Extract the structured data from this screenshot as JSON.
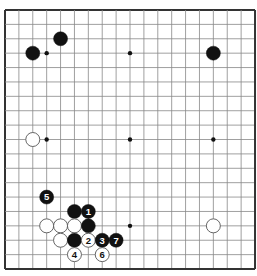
{
  "board": {
    "size": 19,
    "origin": {
      "x": 5,
      "y": 10
    },
    "step": {
      "x": 13.89,
      "y": 14.39
    },
    "line_color": "#888888",
    "border_color": "#333333",
    "background": "#ffffff",
    "hoshi": [
      [
        3,
        3
      ],
      [
        9,
        3
      ],
      [
        15,
        3
      ],
      [
        3,
        9
      ],
      [
        9,
        9
      ],
      [
        15,
        9
      ],
      [
        3,
        15
      ],
      [
        9,
        15
      ],
      [
        15,
        15
      ]
    ]
  },
  "stones": [
    {
      "color": "black",
      "col": 4,
      "row": 2,
      "label": ""
    },
    {
      "color": "black",
      "col": 2,
      "row": 3,
      "label": ""
    },
    {
      "color": "black",
      "col": 15,
      "row": 3,
      "label": ""
    },
    {
      "color": "white",
      "col": 2,
      "row": 9,
      "label": ""
    },
    {
      "color": "black",
      "col": 3,
      "row": 13,
      "label": "5"
    },
    {
      "color": "black",
      "col": 5,
      "row": 14,
      "label": ""
    },
    {
      "color": "black",
      "col": 6,
      "row": 14,
      "label": "1"
    },
    {
      "color": "white",
      "col": 3,
      "row": 15,
      "label": ""
    },
    {
      "color": "white",
      "col": 4,
      "row": 15,
      "label": ""
    },
    {
      "color": "white",
      "col": 5,
      "row": 15,
      "label": ""
    },
    {
      "color": "black",
      "col": 6,
      "row": 15,
      "label": ""
    },
    {
      "color": "white",
      "col": 15,
      "row": 15,
      "label": ""
    },
    {
      "color": "white",
      "col": 4,
      "row": 16,
      "label": ""
    },
    {
      "color": "black",
      "col": 5,
      "row": 16,
      "label": ""
    },
    {
      "color": "white",
      "col": 6,
      "row": 16,
      "label": "2"
    },
    {
      "color": "black",
      "col": 7,
      "row": 16,
      "label": "3"
    },
    {
      "color": "black",
      "col": 8,
      "row": 16,
      "label": "7"
    },
    {
      "color": "white",
      "col": 5,
      "row": 17,
      "label": "4"
    },
    {
      "color": "white",
      "col": 7,
      "row": 17,
      "label": "6"
    }
  ]
}
